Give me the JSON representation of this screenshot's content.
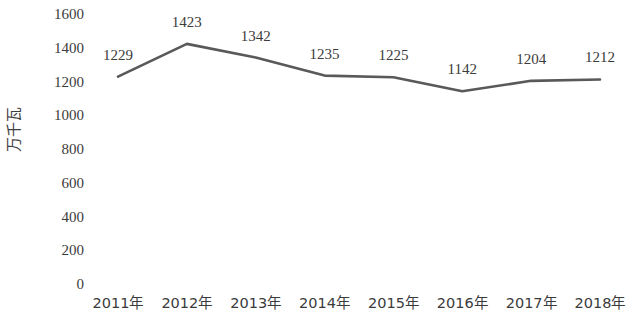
{
  "chart_data": {
    "type": "line",
    "title": "",
    "subtitle": "",
    "xlabel": "",
    "ylabel": "万千瓦",
    "categories": [
      "2011年",
      "2012年",
      "2013年",
      "2014年",
      "2015年",
      "2016年",
      "2017年",
      "2018年"
    ],
    "values": [
      1229,
      1423,
      1342,
      1235,
      1225,
      1142,
      1204,
      1212
    ],
    "series": [
      {
        "name": "装机容量",
        "values": [
          1229,
          1423,
          1342,
          1235,
          1225,
          1142,
          1204,
          1212
        ]
      }
    ],
    "data_labels": [
      "1229",
      "1423",
      "1342",
      "1235",
      "1225",
      "1142",
      "1204",
      "1212"
    ],
    "ylim": [
      0,
      1600
    ],
    "ytick_step": 200,
    "ytick_labels": [
      "1600",
      "1400",
      "1200",
      "1000",
      "800",
      "600",
      "400",
      "200",
      "0"
    ],
    "ytick_values": [
      1600,
      1400,
      1200,
      1000,
      800,
      600,
      400,
      200,
      0
    ],
    "grid": false,
    "legend": "none",
    "line_color": "#595959",
    "line_width": 2.6,
    "markers": false,
    "background_color": "#ffffff",
    "text_color": "#3b3b3b"
  }
}
